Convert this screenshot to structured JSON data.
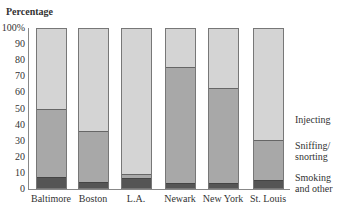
{
  "chart_data": {
    "type": "bar",
    "stacked": true,
    "title": "Percentage",
    "xlabel": "",
    "ylabel": "Percentage",
    "ylim": [
      0,
      100
    ],
    "yticks": [
      "100%",
      "90",
      "80",
      "70",
      "60",
      "50",
      "40",
      "30",
      "20",
      "10",
      "0"
    ],
    "categories": [
      "Baltimore",
      "Boston",
      "L.A.",
      "Newark",
      "New York",
      "St. Louis"
    ],
    "series": [
      {
        "name": "Smoking and other",
        "values": [
          7,
          4,
          6,
          3,
          3,
          5
        ],
        "color": "#555555"
      },
      {
        "name": "Sniffing/ snorting",
        "values": [
          43,
          32,
          3,
          73,
          60,
          25
        ],
        "color": "#a8a8a8"
      },
      {
        "name": "Injecting",
        "values": [
          50,
          64,
          91,
          24,
          37,
          70
        ],
        "color": "#d4d4d4"
      }
    ],
    "legend_position": "right, inline labels",
    "grid": false
  },
  "labels": {
    "title": "Percentage",
    "legend": {
      "injecting": "Injecting",
      "sniffing1": "Sniffing/",
      "sniffing2": "snorting",
      "smoking1": "Smoking",
      "smoking2": "and other"
    }
  }
}
